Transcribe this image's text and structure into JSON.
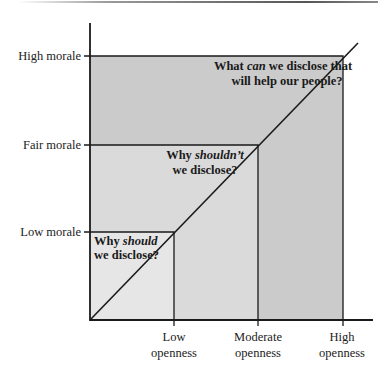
{
  "diagram": {
    "y_axis": {
      "labels": [
        "Low morale",
        "Fair morale",
        "High morale"
      ]
    },
    "x_axis": {
      "labels": [
        {
          "line1": "Low",
          "line2": "openness"
        },
        {
          "line1": "Moderate",
          "line2": "openness"
        },
        {
          "line1": "High",
          "line2": "openness"
        }
      ]
    },
    "zones": [
      {
        "pre": "Why ",
        "em": "should",
        "post": "",
        "line2": "we disclose?"
      },
      {
        "pre": "Why ",
        "em": "shouldn’t",
        "post": "",
        "line2": "we disclose?"
      },
      {
        "pre": "What ",
        "em": "can",
        "post": " we disclose that",
        "line2": "will help our people?"
      }
    ],
    "colors": {
      "zone_low": "#e6e6e6",
      "zone_fair": "#dadada",
      "zone_high": "#cbcbcb",
      "line": "#1a1a1a"
    }
  }
}
